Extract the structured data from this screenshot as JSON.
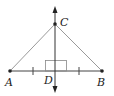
{
  "diagram": {
    "type": "geometry",
    "points": {
      "A": {
        "label": "A",
        "x": 10,
        "y": 71
      },
      "B": {
        "label": "B",
        "x": 102,
        "y": 71
      },
      "C": {
        "label": "C",
        "x": 55,
        "y": 24
      },
      "D": {
        "label": "D",
        "x": 55,
        "y": 71
      }
    },
    "segments": [
      "AC",
      "BC",
      "AB"
    ],
    "perpendicular_line": {
      "through": [
        "C",
        "D"
      ],
      "arrows": "both"
    },
    "right_angle_at": "D",
    "congruence_ticks": [
      "AD",
      "DB"
    ],
    "colors": {
      "lines": "#444444",
      "triangle_sides": "#999999",
      "points": "#222222"
    }
  }
}
